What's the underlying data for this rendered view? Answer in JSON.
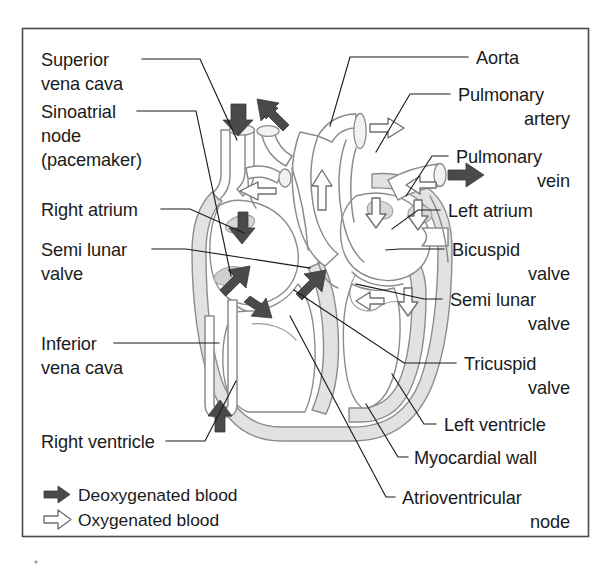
{
  "figure": {
    "kind": "anatomical-diagram",
    "frame_color": "#4c4c4c",
    "background": "#ffffff",
    "text_color": "#1b1b1b"
  },
  "labels_left": [
    {
      "id": "superior-vena-cava",
      "lines": [
        "Superior",
        "vena cava"
      ]
    },
    {
      "id": "sinoatrial-node",
      "lines": [
        "Sinoatrial",
        "node",
        "(pacemaker)"
      ]
    },
    {
      "id": "right-atrium",
      "lines": [
        "Right atrium"
      ]
    },
    {
      "id": "semi-lunar-valve-left",
      "lines": [
        "Semi lunar",
        "valve"
      ]
    },
    {
      "id": "inferior-vena-cava",
      "lines": [
        "Inferior",
        "vena cava"
      ]
    },
    {
      "id": "right-ventricle",
      "lines": [
        "Right ventricle"
      ]
    }
  ],
  "labels_right": [
    {
      "id": "aorta",
      "lines": [
        "Aorta"
      ]
    },
    {
      "id": "pulmonary-artery",
      "lines": [
        "Pulmonary",
        "artery"
      ]
    },
    {
      "id": "pulmonary-vein",
      "lines": [
        "Pulmonary",
        "vein"
      ]
    },
    {
      "id": "left-atrium",
      "lines": [
        "Left atrium"
      ]
    },
    {
      "id": "bicuspid-valve",
      "lines": [
        "Bicuspid",
        "valve"
      ]
    },
    {
      "id": "semi-lunar-valve-right",
      "lines": [
        "Semi lunar",
        "valve"
      ]
    },
    {
      "id": "tricuspid-valve",
      "lines": [
        "Tricuspid",
        "valve"
      ]
    },
    {
      "id": "left-ventricle",
      "lines": [
        "Left ventricle"
      ]
    },
    {
      "id": "myocardial-wall",
      "lines": [
        "Myocardial wall"
      ]
    },
    {
      "id": "atrioventricular-node",
      "lines": [
        "Atrioventricular",
        "node"
      ]
    }
  ],
  "legend": {
    "items": [
      {
        "id": "deoxygenated",
        "icon": "solid-arrow-right-icon",
        "label": "Deoxygenated blood",
        "color": "#4a4a4a"
      },
      {
        "id": "oxygenated",
        "icon": "outline-arrow-right-icon",
        "label": "Oxygenated blood",
        "color": "#ffffff"
      }
    ]
  },
  "text": {
    "superior_vena_cava_1": "Superior",
    "superior_vena_cava_2": "vena cava",
    "sinoatrial_1": "Sinoatrial",
    "sinoatrial_2": "node",
    "sinoatrial_3": "(pacemaker)",
    "right_atrium": "Right atrium",
    "semi_lunar_left_1": "Semi lunar",
    "semi_lunar_left_2": "valve",
    "inferior_vena_cava_1": "Inferior",
    "inferior_vena_cava_2": "vena cava",
    "right_ventricle": "Right ventricle",
    "aorta": "Aorta",
    "pulmonary_artery_1": "Pulmonary",
    "pulmonary_artery_2": "artery",
    "pulmonary_vein_1": "Pulmonary",
    "pulmonary_vein_2": "vein",
    "left_atrium": "Left atrium",
    "bicuspid_1": "Bicuspid",
    "bicuspid_2": "valve",
    "semi_lunar_right_1": "Semi lunar",
    "semi_lunar_right_2": "valve",
    "tricuspid_1": "Tricuspid",
    "tricuspid_2": "valve",
    "left_ventricle": "Left ventricle",
    "myocardial_wall": "Myocardial wall",
    "av_node_1": "Atrioventricular",
    "av_node_2": "node",
    "legend_deox": "Deoxygenated blood",
    "legend_ox": "Oxygenated blood"
  }
}
